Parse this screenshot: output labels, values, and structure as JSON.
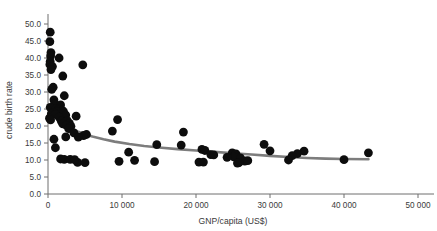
{
  "chart_data": {
    "type": "scatter",
    "title": "",
    "xlabel": "GNP/capita (US$)",
    "ylabel": "crude birth rate",
    "xlim": [
      0,
      52500
    ],
    "ylim": [
      0,
      53
    ],
    "xticks": [
      0,
      10000,
      20000,
      30000,
      40000,
      50000
    ],
    "xticklabels": [
      "0",
      "10 000",
      "20 000",
      "30 000",
      "40 000",
      "50 000"
    ],
    "yticks": [
      0.0,
      5.0,
      10.0,
      15.0,
      20.0,
      25.0,
      30.0,
      35.0,
      40.0,
      45.0,
      50.0
    ],
    "yticklabels": [
      "0.0",
      "5.0",
      "10.0",
      "15.0",
      "20.0",
      "25.0",
      "30.0",
      "35.0",
      "40.0",
      "45.0",
      "50.0"
    ],
    "grid": false,
    "legend": null,
    "marker_color": "#0d0d0d",
    "marker_size": 4.4,
    "trendline_color": "#7d7d7d",
    "trendline_width": 2.6,
    "axis_color": "#6e6e6e",
    "points": [
      [
        300,
        47.6
      ],
      [
        250,
        44.8
      ],
      [
        400,
        41.6
      ],
      [
        350,
        40.6
      ],
      [
        1500,
        40.0
      ],
      [
        300,
        39.0
      ],
      [
        250,
        38.1
      ],
      [
        4700,
        38.0
      ],
      [
        600,
        37.5
      ],
      [
        400,
        36.6
      ],
      [
        2000,
        34.7
      ],
      [
        700,
        31.4
      ],
      [
        500,
        30.8
      ],
      [
        2200,
        28.9
      ],
      [
        800,
        27.7
      ],
      [
        900,
        26.6
      ],
      [
        1700,
        26.2
      ],
      [
        300,
        25.5
      ],
      [
        1100,
        25.2
      ],
      [
        1400,
        25.0
      ],
      [
        1600,
        24.8
      ],
      [
        1900,
        24.6
      ],
      [
        1250,
        24.3
      ],
      [
        2100,
        24.2
      ],
      [
        700,
        24.0
      ],
      [
        450,
        23.6
      ],
      [
        1000,
        23.4
      ],
      [
        2400,
        23.2
      ],
      [
        3800,
        22.9
      ],
      [
        1500,
        22.6
      ],
      [
        9400,
        21.9
      ],
      [
        200,
        22.3
      ],
      [
        350,
        21.8
      ],
      [
        2600,
        21.6
      ],
      [
        1800,
        21.4
      ],
      [
        2300,
        21.1
      ],
      [
        2900,
        20.8
      ],
      [
        2000,
        20.6
      ],
      [
        2500,
        20.2
      ],
      [
        3100,
        19.9
      ],
      [
        2800,
        19.2
      ],
      [
        8700,
        18.5
      ],
      [
        18300,
        18.2
      ],
      [
        3500,
        18.0
      ],
      [
        5200,
        17.5
      ],
      [
        4800,
        17.2
      ],
      [
        4100,
        16.7
      ],
      [
        2400,
        16.8
      ],
      [
        800,
        16.1
      ],
      [
        14700,
        14.5
      ],
      [
        29200,
        14.6
      ],
      [
        18000,
        14.4
      ],
      [
        1000,
        13.6
      ],
      [
        20800,
        13.1
      ],
      [
        21200,
        12.8
      ],
      [
        30000,
        12.7
      ],
      [
        34600,
        12.6
      ],
      [
        43300,
        12.1
      ],
      [
        10900,
        12.3
      ],
      [
        33700,
        11.9
      ],
      [
        22000,
        11.6
      ],
      [
        22400,
        11.5
      ],
      [
        24900,
        12.1
      ],
      [
        25400,
        11.8
      ],
      [
        25100,
        10.9
      ],
      [
        24200,
        10.8
      ],
      [
        33000,
        11.3
      ],
      [
        26000,
        10.6
      ],
      [
        26600,
        9.7
      ],
      [
        27000,
        9.8
      ],
      [
        20400,
        9.4
      ],
      [
        25800,
        9.2
      ],
      [
        32500,
        10.0
      ],
      [
        40000,
        10.1
      ],
      [
        14400,
        9.5
      ],
      [
        11700,
        9.9
      ],
      [
        9600,
        9.6
      ],
      [
        4000,
        9.3
      ],
      [
        5000,
        9.2
      ],
      [
        2200,
        10.2
      ],
      [
        3000,
        10.2
      ],
      [
        3600,
        10.1
      ],
      [
        1700,
        10.3
      ],
      [
        25600,
        9.1
      ],
      [
        21000,
        9.4
      ]
    ],
    "trendline": [
      [
        150,
        25.8
      ],
      [
        500,
        24.6
      ],
      [
        1000,
        23.2
      ],
      [
        1500,
        22.0
      ],
      [
        2000,
        21.0
      ],
      [
        2600,
        20.1
      ],
      [
        3200,
        19.2
      ],
      [
        4000,
        18.4
      ],
      [
        5000,
        17.6
      ],
      [
        6000,
        16.9
      ],
      [
        7500,
        16.1
      ],
      [
        9000,
        15.4
      ],
      [
        11000,
        14.7
      ],
      [
        13000,
        14.1
      ],
      [
        15000,
        13.7
      ],
      [
        17500,
        13.2
      ],
      [
        20000,
        12.8
      ],
      [
        22500,
        12.4
      ],
      [
        25000,
        12.0
      ],
      [
        27500,
        11.6
      ],
      [
        30000,
        11.2
      ],
      [
        32500,
        10.9
      ],
      [
        35000,
        10.6
      ],
      [
        37500,
        10.4
      ],
      [
        40000,
        10.3
      ],
      [
        43300,
        10.2
      ]
    ]
  },
  "axis": {
    "x_title": "GNP/capita (US$)",
    "y_title": "crude birth rate"
  }
}
